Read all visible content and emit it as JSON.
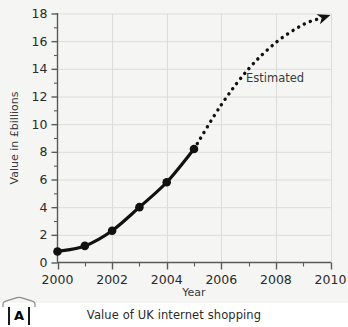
{
  "figure": {
    "badge_label": "A",
    "caption": "Value of UK internet shopping"
  },
  "chart_data": {
    "type": "line",
    "title": "",
    "subtitle": "",
    "xlabel": "Year",
    "ylabel": "Value in £billions",
    "xlim": [
      2000,
      2010
    ],
    "ylim": [
      0,
      18
    ],
    "x_ticks": [
      2000,
      2001,
      2002,
      2003,
      2004,
      2005,
      2006,
      2007,
      2008,
      2009,
      2010
    ],
    "x_tick_labels": [
      "2000",
      "",
      "2002",
      "",
      "2004",
      "",
      "2006",
      "",
      "2008",
      "",
      "2010"
    ],
    "x_major_ticks": [
      2000,
      2002,
      2004,
      2006,
      2008,
      2010
    ],
    "y_ticks": [
      0,
      1,
      2,
      3,
      4,
      5,
      6,
      7,
      8,
      9,
      10,
      11,
      12,
      13,
      14,
      15,
      16,
      17,
      18
    ],
    "y_tick_labels": [
      "0",
      "",
      "2",
      "",
      "4",
      "",
      "6",
      "",
      "8",
      "",
      "10",
      "",
      "12",
      "",
      "14",
      "",
      "16",
      "",
      "18"
    ],
    "y_major_ticks": [
      0,
      2,
      4,
      6,
      8,
      10,
      12,
      14,
      16,
      18
    ],
    "grid": true,
    "grid_axis": "both",
    "grid_color": "#dcdcda",
    "legend": false,
    "series": [
      {
        "name": "Actual",
        "style": "solid",
        "markers": true,
        "color": "#111111",
        "x": [
          2000,
          2001,
          2002,
          2003,
          2004,
          2005
        ],
        "values": [
          0.8,
          1.2,
          2.3,
          4.0,
          5.8,
          8.2
        ]
      },
      {
        "name": "Estimated",
        "style": "dotted",
        "markers": false,
        "arrow": true,
        "color": "#111111",
        "x": [
          2005,
          2006,
          2007,
          2008,
          2009,
          2010
        ],
        "values": [
          8.2,
          11.4,
          14.0,
          15.9,
          17.2,
          17.9
        ]
      }
    ],
    "annotations": [
      {
        "text": "Estimated",
        "x": 2007.0,
        "y": 13.0
      }
    ]
  }
}
